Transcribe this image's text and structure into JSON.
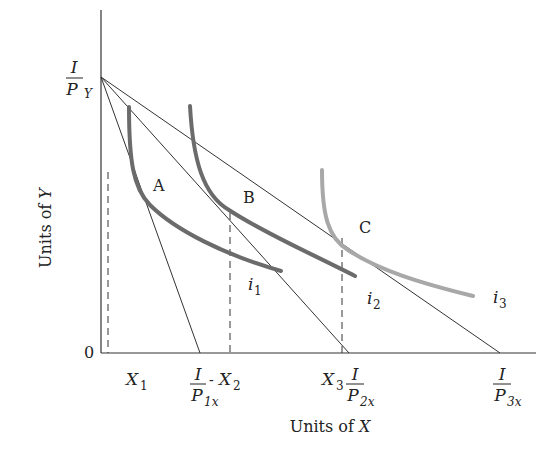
{
  "diagram": {
    "axes": {
      "x_label_prefix": "Units of ",
      "x_label_var": "X",
      "y_label_prefix": "Units of ",
      "y_label_var": "Y",
      "origin_label": "0"
    },
    "y_intercept": {
      "numerator": "I",
      "denominator": "P",
      "subscript": "Y"
    },
    "x_intercepts": [
      {
        "numerator": "I",
        "denominator": "P",
        "subscript": "1x"
      },
      {
        "numerator": "I",
        "denominator": "P",
        "subscript": "2x"
      },
      {
        "numerator": "I",
        "denominator": "P",
        "subscript": "3x"
      }
    ],
    "quantities": [
      {
        "var": "X",
        "sub": "1"
      },
      {
        "var": "X",
        "sub": "2"
      },
      {
        "var": "X",
        "sub": "3"
      }
    ],
    "points": [
      "A",
      "B",
      "C"
    ],
    "curves": [
      {
        "name": "i",
        "sub": "1",
        "color": "#6b6b6b"
      },
      {
        "name": "i",
        "sub": "2",
        "color": "#6b6b6b"
      },
      {
        "name": "i",
        "sub": "3",
        "color": "#a8a8a8"
      }
    ],
    "separator": "-"
  }
}
